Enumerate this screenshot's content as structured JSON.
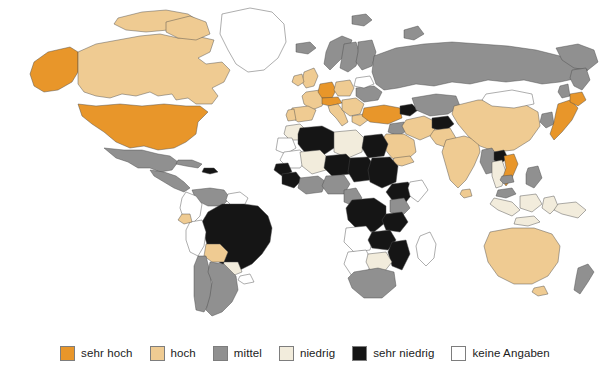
{
  "figure": {
    "type": "choropleth-world-map",
    "language": "de",
    "background_color": "#ffffff"
  },
  "legend": {
    "orientation": "horizontal",
    "position": "bottom-center",
    "items": [
      {
        "label": "sehr hoch",
        "color": "#e8962a",
        "key": "sehr-hoch"
      },
      {
        "label": "hoch",
        "color": "#efcb92",
        "key": "hoch"
      },
      {
        "label": "mittel",
        "color": "#909090",
        "key": "mittel"
      },
      {
        "label": "niedrig",
        "color": "#f2ecdc",
        "key": "niedrig"
      },
      {
        "label": "sehr niedrig",
        "color": "#151515",
        "key": "sehr-niedrig"
      },
      {
        "label": "keine Angaben",
        "color": "#ffffff",
        "key": "keine-angaben"
      }
    ]
  },
  "map": {
    "outline_color": "#4a4a4a",
    "ocean_color": "#ffffff",
    "classes": {
      "sehr-hoch": "#e8962a",
      "hoch": "#efcb92",
      "mittel": "#909090",
      "niedrig": "#f2ecdc",
      "sehr-niedrig": "#151515",
      "keine-angaben": "#ffffff"
    },
    "regions": [
      {
        "name": "Vereinigte Staaten",
        "class": "sehr-hoch"
      },
      {
        "name": "Alaska",
        "class": "sehr-hoch"
      },
      {
        "name": "Kanada",
        "class": "hoch"
      },
      {
        "name": "Groenland",
        "class": "keine-angaben"
      },
      {
        "name": "Mexiko",
        "class": "mittel"
      },
      {
        "name": "Mittelamerika",
        "class": "mittel"
      },
      {
        "name": "Kuba",
        "class": "mittel"
      },
      {
        "name": "Hispaniola",
        "class": "sehr-niedrig"
      },
      {
        "name": "Venezuela",
        "class": "mittel"
      },
      {
        "name": "Kolumbien",
        "class": "keine-angaben"
      },
      {
        "name": "Guyana-Region",
        "class": "keine-angaben"
      },
      {
        "name": "Brasilien",
        "class": "sehr-niedrig"
      },
      {
        "name": "Peru",
        "class": "keine-angaben"
      },
      {
        "name": "Ecuador",
        "class": "hoch"
      },
      {
        "name": "Bolivien",
        "class": "hoch"
      },
      {
        "name": "Paraguay",
        "class": "niedrig"
      },
      {
        "name": "Uruguay",
        "class": "keine-angaben"
      },
      {
        "name": "Chile",
        "class": "mittel"
      },
      {
        "name": "Argentinien",
        "class": "mittel"
      },
      {
        "name": "Island",
        "class": "mittel"
      },
      {
        "name": "Norwegen",
        "class": "mittel"
      },
      {
        "name": "Schweden",
        "class": "mittel"
      },
      {
        "name": "Finnland",
        "class": "mittel"
      },
      {
        "name": "Grossbritannien",
        "class": "hoch"
      },
      {
        "name": "Irland",
        "class": "hoch"
      },
      {
        "name": "Frankreich",
        "class": "hoch"
      },
      {
        "name": "Spanien",
        "class": "hoch"
      },
      {
        "name": "Portugal",
        "class": "hoch"
      },
      {
        "name": "Deutschland",
        "class": "sehr-hoch"
      },
      {
        "name": "Oesterreich",
        "class": "sehr-hoch"
      },
      {
        "name": "Schweiz",
        "class": "sehr-hoch"
      },
      {
        "name": "Italien",
        "class": "hoch"
      },
      {
        "name": "Polen",
        "class": "hoch"
      },
      {
        "name": "Balkan",
        "class": "hoch"
      },
      {
        "name": "Griechenland",
        "class": "hoch"
      },
      {
        "name": "Ukraine",
        "class": "mittel"
      },
      {
        "name": "Weissrussland",
        "class": "keine-angaben"
      },
      {
        "name": "Russland",
        "class": "mittel"
      },
      {
        "name": "Tuerkei",
        "class": "sehr-hoch"
      },
      {
        "name": "Kaukasus",
        "class": "sehr-niedrig"
      },
      {
        "name": "Iran",
        "class": "hoch"
      },
      {
        "name": "Irak",
        "class": "mittel"
      },
      {
        "name": "Saudi-Arabien",
        "class": "hoch"
      },
      {
        "name": "Jemen",
        "class": "hoch"
      },
      {
        "name": "Zentralasien",
        "class": "mittel"
      },
      {
        "name": "Afghanistan",
        "class": "sehr-niedrig"
      },
      {
        "name": "Pakistan",
        "class": "hoch"
      },
      {
        "name": "Indien",
        "class": "hoch"
      },
      {
        "name": "China",
        "class": "hoch"
      },
      {
        "name": "Mongolei",
        "class": "keine-angaben"
      },
      {
        "name": "Japan",
        "class": "sehr-hoch"
      },
      {
        "name": "Korea",
        "class": "mittel"
      },
      {
        "name": "Myanmar",
        "class": "mittel"
      },
      {
        "name": "Laos",
        "class": "sehr-niedrig"
      },
      {
        "name": "Thailand",
        "class": "niedrig"
      },
      {
        "name": "Vietnam",
        "class": "sehr-hoch"
      },
      {
        "name": "Kambodscha",
        "class": "mittel"
      },
      {
        "name": "Malaysia",
        "class": "mittel"
      },
      {
        "name": "Indonesien",
        "class": "niedrig"
      },
      {
        "name": "Philippinen",
        "class": "mittel"
      },
      {
        "name": "Papua-Neuguinea",
        "class": "niedrig"
      },
      {
        "name": "Australien",
        "class": "hoch"
      },
      {
        "name": "Neuseeland",
        "class": "mittel"
      },
      {
        "name": "Marokko",
        "class": "niedrig"
      },
      {
        "name": "Algerien",
        "class": "sehr-niedrig"
      },
      {
        "name": "Libyen",
        "class": "niedrig"
      },
      {
        "name": "Aegypten",
        "class": "sehr-niedrig"
      },
      {
        "name": "Westsahara",
        "class": "keine-angaben"
      },
      {
        "name": "Mauretanien",
        "class": "keine-angaben"
      },
      {
        "name": "Mali",
        "class": "niedrig"
      },
      {
        "name": "Niger",
        "class": "sehr-niedrig"
      },
      {
        "name": "Tschad",
        "class": "sehr-niedrig"
      },
      {
        "name": "Sudan",
        "class": "sehr-niedrig"
      },
      {
        "name": "Aethiopien",
        "class": "sehr-niedrig"
      },
      {
        "name": "Somalia",
        "class": "keine-angaben"
      },
      {
        "name": "Senegal",
        "class": "sehr-niedrig"
      },
      {
        "name": "Guinea",
        "class": "sehr-niedrig"
      },
      {
        "name": "Nigeria",
        "class": "mittel"
      },
      {
        "name": "Kamerun",
        "class": "mittel"
      },
      {
        "name": "Kongo",
        "class": "sehr-niedrig"
      },
      {
        "name": "Kenia",
        "class": "mittel"
      },
      {
        "name": "Tansania",
        "class": "sehr-niedrig"
      },
      {
        "name": "Angola",
        "class": "keine-angaben"
      },
      {
        "name": "Sambia",
        "class": "sehr-niedrig"
      },
      {
        "name": "Mosambik",
        "class": "sehr-niedrig"
      },
      {
        "name": "Namibia",
        "class": "keine-angaben"
      },
      {
        "name": "Botswana",
        "class": "niedrig"
      },
      {
        "name": "Suedafrika",
        "class": "mittel"
      },
      {
        "name": "Madagaskar",
        "class": "keine-angaben"
      }
    ]
  }
}
